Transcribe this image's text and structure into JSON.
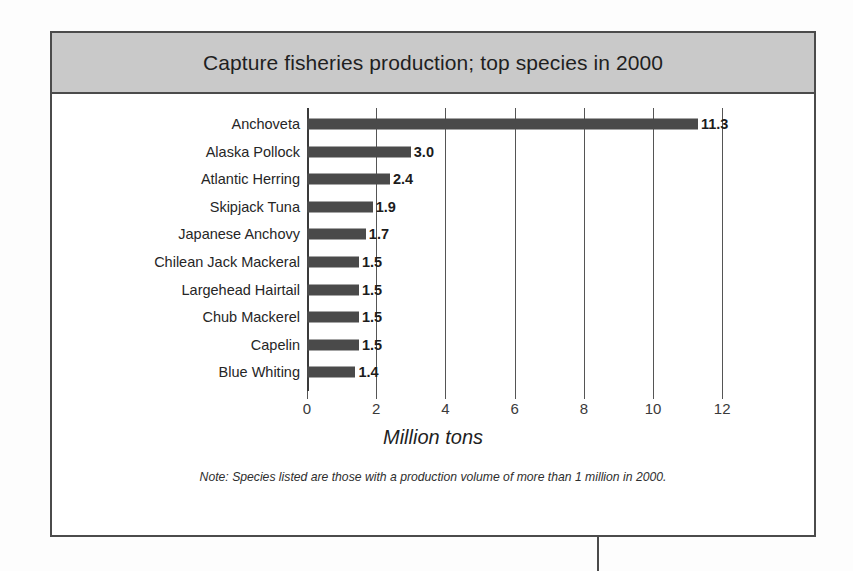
{
  "figure": {
    "title": "Capture fisheries production;  top species in 2000",
    "axis_title": "Million tons",
    "note": "Note: Species listed are those with a production volume of more than 1 million in 2000.",
    "frame_color": "#4b4b4b",
    "title_band_color": "#c9c9c9",
    "bar_color": "#4a4a4a"
  },
  "chart_data": {
    "type": "bar",
    "orientation": "horizontal",
    "title": "Capture fisheries production;  top species in 2000",
    "xlabel": "Million tons",
    "ylabel": "",
    "xlim": [
      0,
      12
    ],
    "xticks": [
      0,
      2,
      4,
      6,
      8,
      10,
      12
    ],
    "xtick_labels": [
      "0",
      "2",
      "4",
      "6",
      "8",
      "10",
      "12"
    ],
    "grid": true,
    "legend": "none",
    "annotation": "Note: Species listed are those with a production volume of more than 1 million in 2000.",
    "categories": [
      "Anchoveta",
      "Alaska Pollock",
      "Atlantic Herring",
      "Skipjack Tuna",
      "Japanese Anchovy",
      "Chilean Jack Mackeral",
      "Largehead Hairtail",
      "Chub Mackerel",
      "Capelin",
      "Blue Whiting"
    ],
    "values": [
      11.3,
      3.0,
      2.4,
      1.9,
      1.7,
      1.5,
      1.5,
      1.5,
      1.5,
      1.4
    ],
    "value_labels": [
      "11.3",
      "3.0",
      "2.4",
      "1.9",
      "1.7",
      "1.5",
      "1.5",
      "1.5",
      "1.5",
      "1.4"
    ]
  }
}
